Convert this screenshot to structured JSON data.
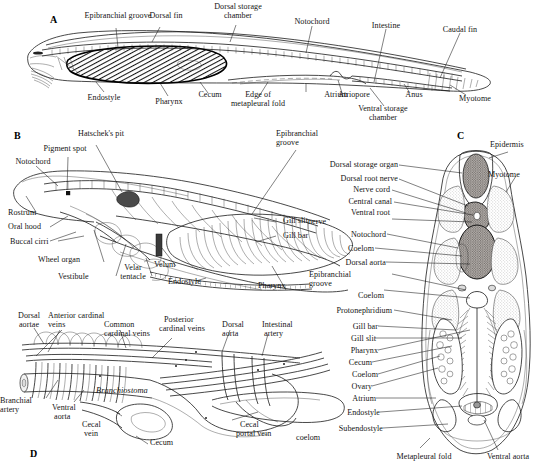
{
  "figure": {
    "organism": "Branchiostoma",
    "background": "#ffffff",
    "ink": "#141414"
  },
  "panels": [
    {
      "id": "A",
      "letter": "A",
      "caption": "Whole-animal lateral view",
      "labels": [
        "Epibranchial groove",
        "Dorsal fin",
        "Dorsal storage chamber",
        "Notochord",
        "Intestine",
        "Caudal fin",
        "Endostyle",
        "Pharynx",
        "Cecum",
        "Edge of metapleural fold",
        "Atrium",
        "Atriopore",
        "Anus",
        "Myotome",
        "Ventral storage chamber"
      ]
    },
    {
      "id": "B",
      "letter": "B",
      "caption": "Anterior region, lateral view",
      "labels": [
        "Hatschek's pit",
        "Pigment spot",
        "Notochord",
        "Epibranchial groove",
        "Rostrum",
        "Oral hood",
        "Buccal cirri",
        "Wheel organ",
        "Vestibule",
        "Velar tentacle",
        "Velum",
        "Endostyle",
        "Pharynx",
        "Gill slit",
        "Gill bar"
      ]
    },
    {
      "id": "C",
      "letter": "C",
      "caption": "Transverse section through the pharynx",
      "labels_left": [
        "Dorsal storage organ",
        "Dorsal root nerve",
        "Nerve cord",
        "Central canal",
        "Ventral root nerve",
        "Notochord",
        "Coelom",
        "Dorsal aorta",
        "Epibranchial groove",
        "Coelom",
        "Protonephridium",
        "Gill bar",
        "Gill slit",
        "Pharynx",
        "Cecum",
        "Coelom",
        "Ovary",
        "Atrium",
        "Endostyle",
        "Subendostyle coelom"
      ],
      "labels_right": [
        "Epidermis",
        "Myotome"
      ],
      "labels_bottom": [
        "Metapleural fold",
        "Ventral aorta"
      ]
    },
    {
      "id": "D",
      "letter": "D",
      "caption": "Circulatory system",
      "organism_label": "Branchiostoma",
      "labels": [
        "Dorsal aortae",
        "Anterior cardinal veins",
        "Common cardinal veins",
        "Posterior cardinal veins",
        "Dorsal aorta",
        "Intestinal artery",
        "Branchial artery",
        "Ventral aorta",
        "Cecal vein",
        "Cecum",
        "Cecal portal vein"
      ]
    }
  ],
  "labels": {
    "a_epibranchial_groove": "Epibranchial groove",
    "a_dorsal_fin": "Dorsal fin",
    "a_dorsal_storage_1": "Dorsal storage",
    "a_dorsal_storage_2": "chamber",
    "a_notochord": "Notochord",
    "a_intestine": "Intestine",
    "a_caudal_fin": "Caudal fin",
    "a_endostyle": "Endostyle",
    "a_pharynx": "Pharynx",
    "a_cecum": "Cecum",
    "a_edge_1": "Edge of",
    "a_edge_2": "metapleural fold",
    "a_atrium": "Atrium",
    "a_atriopore": "Atriopore",
    "a_anus": "Anus",
    "a_myotome": "Myotome",
    "a_ventral_storage_1": "Ventral storage",
    "a_ventral_storage_2": "chamber",
    "b_hatscheks_pit": "Hatschek's pit",
    "b_pigment_spot": "Pigment spot",
    "b_notochord": "Notochord",
    "b_epibranchial_1": "Epibranchial",
    "b_epibranchial_2": "groove",
    "b_rostrum": "Rostrum",
    "b_oral_hood": "Oral hood",
    "b_buccal_cirri": "Buccal cirri",
    "b_wheel_organ": "Wheel organ",
    "b_vestibule": "Vestibule",
    "b_velar_1": "Velar",
    "b_velar_2": "tentacle",
    "b_velum": "Velum",
    "b_endostyle": "Endostyle",
    "b_pharynx": "Pharynx",
    "b_gill_slit": "Gill slit",
    "b_gill_bar": "Gill bar",
    "c_dorsal_storage_organ": "Dorsal storage organ",
    "c_dorsal_root_nerve": "Dorsal root nerve",
    "c_nerve_cord": "Nerve cord",
    "c_central_canal": "Central canal",
    "c_ventral_root_1": "Ventral root",
    "c_ventral_root_2": "nerve",
    "c_notochord": "Notochord",
    "c_coelom_1": "Coelom",
    "c_dorsal_aorta": "Dorsal aorta",
    "c_epibranchial_1": "Epibranchial",
    "c_epibranchial_2": "groove",
    "c_coelom_2": "Coelom",
    "c_protonephridium": "Protonephridium",
    "c_gill_bar": "Gill bar",
    "c_gill_slit": "Gill slit",
    "c_pharynx": "Pharynx",
    "c_cecum": "Cecum",
    "c_coelom_3": "Coelom",
    "c_ovary": "Ovary",
    "c_atrium": "Atrium",
    "c_endostyle": "Endostyle",
    "c_subendostyle_1": "Subendostyle",
    "c_subendostyle_2": "coelom",
    "c_epidermis": "Epidermis",
    "c_myotome": "Myotome",
    "c_metapleural_fold": "Metapleural fold",
    "c_ventral_aorta": "Ventral aorta",
    "d_dorsal_1": "Dorsal",
    "d_dorsal_2": "aortae",
    "d_anterior_1": "Anterior cardinal",
    "d_anterior_2": "veins",
    "d_common_1": "Common",
    "d_common_2": "cardinal veins",
    "d_posterior_1": "Posterior",
    "d_posterior_2": "cardinal veins",
    "d_dorsal_aorta_1": "Dorsal",
    "d_dorsal_aorta_2": "aorta",
    "d_intestinal_1": "Intestinal",
    "d_intestinal_2": "artery",
    "d_branchial_1": "Branchial",
    "d_branchial_2": "artery",
    "d_ventral_1": "Ventral",
    "d_ventral_2": "aorta",
    "d_cecal_vein_1": "Cecal",
    "d_cecal_vein_2": "vein",
    "d_cecum": "Cecum",
    "d_cecal_portal_1": "Cecal",
    "d_cecal_portal_2": "portal vein",
    "d_branchiostoma": "Branchiostoma",
    "panel_a": "A",
    "panel_b": "B",
    "panel_c": "C",
    "panel_d": "D"
  }
}
